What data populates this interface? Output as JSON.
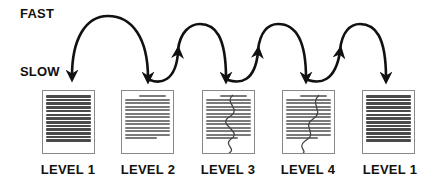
{
  "axis": {
    "fast_label": "FAST",
    "slow_label": "SLOW"
  },
  "levels": [
    {
      "label": "LEVEL 1",
      "style": "dense-upright"
    },
    {
      "label": "LEVEL 2",
      "style": "upside-down"
    },
    {
      "label": "LEVEL 3",
      "style": "upside-down-traced"
    },
    {
      "label": "LEVEL 4",
      "style": "upside-down-traced"
    },
    {
      "label": "LEVEL 1",
      "style": "dense-upright"
    }
  ],
  "colors": {
    "ink": "#111111",
    "page_border": "#888888",
    "text_lines": "#7a7a7a"
  }
}
